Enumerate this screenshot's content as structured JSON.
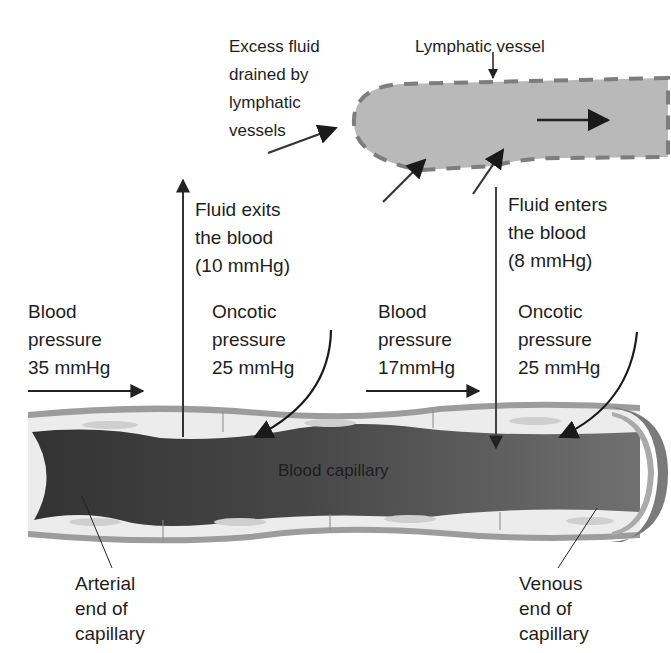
{
  "diagram": {
    "colors": {
      "background": "#ffffff",
      "text": "#1e1e1e",
      "arterial_blood": "#3a3a3a",
      "venous_blood": "#6e6e6e",
      "vessel_wall_outer": "#9a9a9a",
      "vessel_wall_inner": "#ececec",
      "lymph_fill": "#b7b7b7",
      "lymph_border": "#7d7d7d",
      "arrow": "#222222"
    },
    "labels": {
      "excess_fluid": [
        "Excess fluid",
        "drained by",
        "lymphatic",
        "vessels"
      ],
      "lymphatic_vessel": "Lymphatic vessel",
      "fluid_exits": [
        "Fluid exits",
        "the blood",
        "(10 mmHg)"
      ],
      "fluid_enters": [
        "Fluid enters",
        "the blood",
        "(8 mmHg)"
      ],
      "bp_arterial": [
        "Blood",
        "pressure",
        "35 mmHg"
      ],
      "oncotic_arterial": [
        "Oncotic",
        "pressure",
        "25 mmHg"
      ],
      "bp_venous": [
        "Blood",
        "pressure",
        "17mmHg"
      ],
      "oncotic_venous": [
        "Oncotic",
        "pressure",
        "25 mmHg"
      ],
      "blood_capillary": "Blood capillary",
      "arterial_end": [
        "Arterial",
        "end of",
        "capillary"
      ],
      "venous_end": [
        "Venous",
        "end of",
        "capillary"
      ]
    },
    "values": {
      "arterial_blood_pressure_mmHg": 35,
      "arterial_oncotic_pressure_mmHg": 25,
      "fluid_exit_pressure_mmHg": 10,
      "venous_blood_pressure_mmHg": 17,
      "venous_oncotic_pressure_mmHg": 25,
      "fluid_enter_pressure_mmHg": 8
    }
  }
}
